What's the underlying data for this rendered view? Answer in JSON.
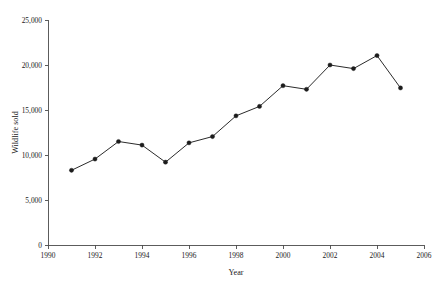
{
  "chart_data": {
    "type": "line",
    "title": "",
    "subtitle": "",
    "xlabel": "Year",
    "ylabel": "Wildlife sold",
    "xlim": [
      1990,
      2006
    ],
    "ylim": [
      0,
      25000
    ],
    "xticks": [
      1990,
      1992,
      1994,
      1996,
      1998,
      2000,
      2002,
      2004,
      2006
    ],
    "xtick_labels": [
      "1990",
      "1992",
      "1994",
      "1996",
      "1998",
      "2000",
      "2002",
      "2004",
      "2006"
    ],
    "yticks": [
      0,
      5000,
      10000,
      15000,
      20000,
      25000
    ],
    "ytick_labels": [
      "0",
      "5,000",
      "10,000",
      "15,000",
      "20,000",
      "25,000"
    ],
    "grid": false,
    "legend": false,
    "legend_position": "none",
    "marker": "filled-circle",
    "line_color": "#2b2b2b",
    "marker_color": "#1c1c1c",
    "axis_color": "#4a4a4a",
    "background_color": "#ffffff",
    "x": [
      1991,
      1992,
      1993,
      1994,
      1995,
      1996,
      1997,
      1998,
      1999,
      2000,
      2001,
      2002,
      2003,
      2004,
      2005
    ],
    "values": [
      8300,
      9550,
      11500,
      11100,
      9200,
      11350,
      12050,
      14350,
      15400,
      17700,
      17300,
      20000,
      19600,
      21050,
      17450
    ],
    "series": [
      {
        "name": "Wildlife sold",
        "x": [
          1991,
          1992,
          1993,
          1994,
          1995,
          1996,
          1997,
          1998,
          1999,
          2000,
          2001,
          2002,
          2003,
          2004,
          2005
        ],
        "values": [
          8300,
          9550,
          11500,
          11100,
          9200,
          11350,
          12050,
          14350,
          15400,
          17700,
          17300,
          20000,
          19600,
          21050,
          17450
        ]
      }
    ],
    "annotations": []
  }
}
